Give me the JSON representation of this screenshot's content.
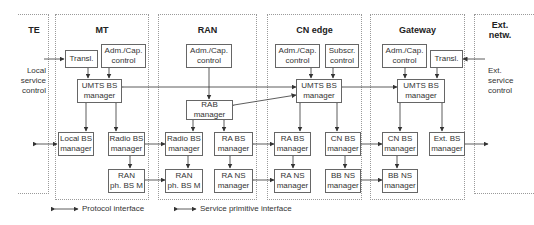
{
  "columns": [
    {
      "id": "te",
      "title": "TE"
    },
    {
      "id": "mt",
      "title": "MT"
    },
    {
      "id": "ran",
      "title": "RAN"
    },
    {
      "id": "cn",
      "title": "CN edge"
    },
    {
      "id": "gw",
      "title": "Gateway"
    },
    {
      "id": "ext",
      "title": "Ext.\nnetw."
    }
  ],
  "side_labels": {
    "left": "Local\nservice\ncontrol",
    "right": "Ext.\nservice\ncontrol"
  },
  "boxes": {
    "mt_transl": "Transl.",
    "mt_adm": "Adm./Cap.\ncontrol",
    "mt_umts": "UMTS BS\nmanager",
    "mt_local": "Local BS\nmanager",
    "mt_radio": "Radio BS\nmanager",
    "mt_ranph": "RAN\nph. BS M",
    "ran_adm": "Adm./Cap.\ncontrol",
    "ran_rab": "RAB\nmanager",
    "ran_radio": "Radio BS\nmanager",
    "ran_ranph": "RAN\nph. BS M",
    "ran_rabs": "RA BS\nmanager",
    "ran_rans": "RA NS\nmanager",
    "cn_adm": "Adm./Cap.\ncontrol",
    "cn_subscr": "Subscr.\ncontrol",
    "cn_umts": "UMTS BS\nmanager",
    "cn_rabs": "RA BS\nmanager",
    "cn_rans": "RA NS\nmanager",
    "cn_cnbs": "CN BS\nmanager",
    "cn_bbns": "BB NS\nmanager",
    "gw_adm": "Adm./Cap.\ncontrol",
    "gw_transl": "Transl.",
    "gw_umts": "UMTS BS\nmanager",
    "gw_cnbs": "CN BS\nmanager",
    "gw_bbns": "BB NS\nmanager",
    "gw_ext": "Ext. BS\nmanager"
  },
  "legend": {
    "protocol": "Protocol interface",
    "service": "Service primitive interface"
  }
}
